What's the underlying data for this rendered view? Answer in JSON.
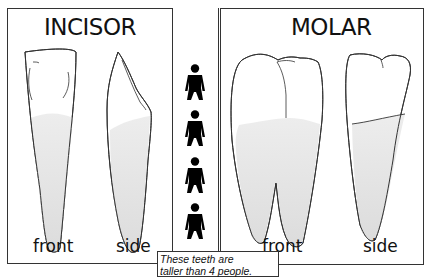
{
  "left_panel": {
    "title": "INCISOR",
    "labels": {
      "front": "front",
      "side": "side"
    }
  },
  "right_panel": {
    "title": "MOLAR",
    "labels": {
      "front": "front",
      "side": "side"
    }
  },
  "people": {
    "count": 4,
    "icon": "person-silhouette-icon"
  },
  "caption": {
    "line1": "These teeth are",
    "line2": "taller than 4 people."
  },
  "colors": {
    "outline": "#333333",
    "root_fill": "#e4e4e4",
    "person": "#000000"
  }
}
